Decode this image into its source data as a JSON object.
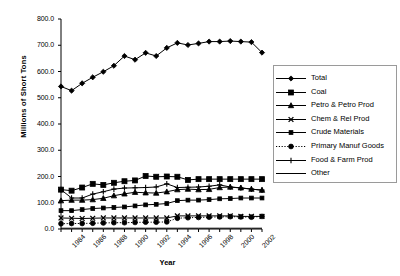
{
  "chart_data": {
    "type": "line",
    "title": "",
    "xlabel": "Year",
    "ylabel": "Millions of Short Tons",
    "xlim": [
      1984,
      2003
    ],
    "ylim": [
      0,
      800
    ],
    "grid": false,
    "legend_position": "right",
    "x": [
      1984,
      1985,
      1986,
      1987,
      1988,
      1989,
      1990,
      1991,
      1992,
      1993,
      1994,
      1995,
      1996,
      1997,
      1998,
      1999,
      2000,
      2001,
      2002,
      2003
    ],
    "ytick_labels": [
      "0.0",
      "100.0",
      "200.0",
      "300.0",
      "400.0",
      "500.0",
      "600.0",
      "700.0",
      "800.0"
    ],
    "ytick_values": [
      0,
      100,
      200,
      300,
      400,
      500,
      600,
      700,
      800
    ],
    "xtick_labels": [
      "1984",
      "1986",
      "1988",
      "1990",
      "1992",
      "1994",
      "1996",
      "1998",
      "2000",
      "2002"
    ],
    "xtick_values": [
      1984,
      1986,
      1988,
      1990,
      1992,
      1994,
      1996,
      1998,
      2000,
      2002
    ],
    "series": [
      {
        "name": "Total",
        "marker": "diamond",
        "dash": "solid",
        "values": [
          543,
          527,
          555,
          578,
          599,
          622,
          659,
          645,
          671,
          659,
          690,
          709,
          701,
          707,
          714,
          714,
          716,
          714,
          712,
          672
        ]
      },
      {
        "name": "Coal",
        "marker": "square",
        "dash": "solid",
        "values": [
          150,
          146,
          158,
          172,
          168,
          176,
          182,
          185,
          202,
          199,
          200,
          199,
          187,
          190,
          190,
          190,
          190,
          190,
          190,
          190
        ]
      },
      {
        "name": "Petro & Petro Prod",
        "marker": "triangle",
        "dash": "solid",
        "values": [
          108,
          110,
          110,
          112,
          117,
          127,
          134,
          140,
          138,
          137,
          142,
          150,
          152,
          150,
          151,
          158,
          160,
          157,
          152,
          148
        ]
      },
      {
        "name": "Chem & Rel Prod",
        "marker": "x",
        "dash": "solid",
        "values": [
          42,
          41,
          40,
          41,
          42,
          42,
          42,
          42,
          42,
          42,
          42,
          50,
          50,
          50,
          50,
          50,
          50,
          48,
          48,
          48
        ]
      },
      {
        "name": "Crude Materials",
        "marker": "square-small",
        "dash": "solid",
        "values": [
          70,
          70,
          74,
          78,
          80,
          82,
          84,
          88,
          92,
          94,
          97,
          108,
          110,
          110,
          112,
          115,
          116,
          118,
          118,
          118
        ]
      },
      {
        "name": "Primary Manuf Goods",
        "marker": "circle",
        "dash": "dotted",
        "values": [
          20,
          21,
          21,
          22,
          23,
          24,
          24,
          25,
          26,
          26,
          27,
          41,
          43,
          44,
          45,
          46,
          47,
          46,
          45,
          48
        ]
      },
      {
        "name": "Food & Farm Prod",
        "marker": "plus",
        "dash": "solid",
        "values": [
          150,
          118,
          118,
          133,
          142,
          152,
          156,
          157,
          158,
          160,
          172,
          158,
          159,
          160,
          163,
          168,
          160,
          156,
          152,
          148
        ]
      },
      {
        "name": "Other",
        "marker": "line",
        "dash": "solid",
        "values": [
          3,
          3,
          3,
          3,
          3,
          3,
          3,
          3,
          3,
          3,
          3,
          3,
          3,
          3,
          3,
          3,
          3,
          3,
          3,
          3
        ]
      }
    ]
  },
  "legend": {
    "items": [
      {
        "label": "Total"
      },
      {
        "label": "Coal"
      },
      {
        "label": "Petro & Petro Prod"
      },
      {
        "label": "Chem & Rel Prod"
      },
      {
        "label": "Crude Materials"
      },
      {
        "label": "Primary Manuf Goods"
      },
      {
        "label": "Food & Farm Prod"
      },
      {
        "label": "Other"
      }
    ]
  },
  "colors": {
    "series": "#000000",
    "axis": "#000000",
    "legend_border": "#9a9a9a",
    "background": "#ffffff"
  }
}
